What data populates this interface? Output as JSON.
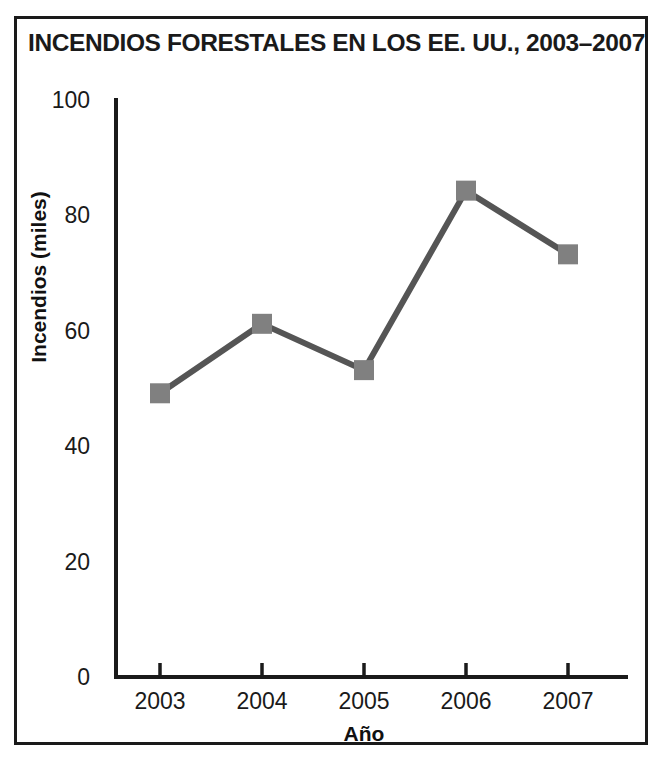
{
  "figure": {
    "title": "INCENDIOS FORESTALES EN LOS EE. UU., 2003–2007",
    "border_color": "#1a1a1a",
    "background": "#ffffff"
  },
  "chart_data": {
    "type": "line",
    "title": "INCENDIOS FORESTALES EN LOS EE. UU., 2003–2007",
    "xlabel": "Año",
    "ylabel": "Incendios (miles)",
    "categories": [
      "2003",
      "2004",
      "2005",
      "2006",
      "2007"
    ],
    "x": [
      2003,
      2004,
      2005,
      2006,
      2007
    ],
    "values": [
      49,
      61,
      53,
      84,
      73
    ],
    "series": [
      {
        "name": "Incendios (miles)",
        "values": [
          49,
          61,
          53,
          84,
          73
        ]
      }
    ],
    "ylim": [
      0,
      100
    ],
    "yticks": [
      0,
      20,
      40,
      60,
      80,
      100
    ],
    "ytick_labels": [
      "0",
      "20",
      "40",
      "60",
      "80",
      "100"
    ],
    "xtick_labels": [
      "2003",
      "2004",
      "2005",
      "2006",
      "2007"
    ],
    "grid": false,
    "legend": null,
    "legend_position": "none",
    "line_color": "#555555",
    "marker_color": "#808080",
    "marker_shape": "square",
    "axis_color": "#1a1a1a"
  }
}
